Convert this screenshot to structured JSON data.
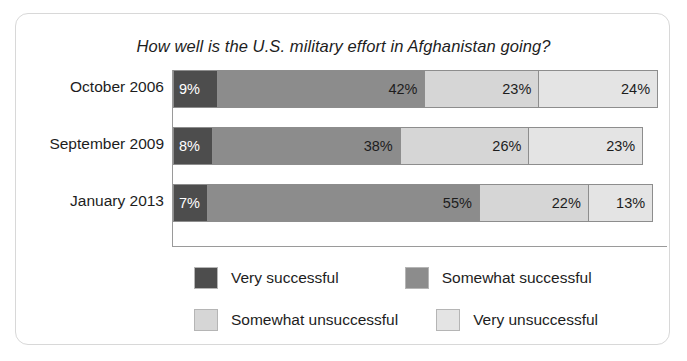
{
  "chart_data": {
    "type": "bar",
    "orientation": "horizontal",
    "stacked": true,
    "title": "How well is the U.S. military effort in Afghanistan going?",
    "xlabel": "",
    "ylabel": "",
    "grid": false,
    "axis_visible": true,
    "legend_position": "bottom",
    "value_suffix": "%",
    "xlim": [
      0,
      100
    ],
    "categories": [
      "October 2006",
      "September 2009",
      "January 2013"
    ],
    "series": [
      {
        "name": "Very successful",
        "color": "#4d4d4d",
        "label_color": "#ffffff",
        "values": [
          9,
          8,
          7
        ],
        "labels": [
          "9%",
          "8%",
          "7%"
        ]
      },
      {
        "name": "Somewhat successful",
        "color": "#8c8c8c",
        "label_color": "#1d1d1d",
        "values": [
          42,
          38,
          55
        ],
        "labels": [
          "42%",
          "38%",
          "55%"
        ]
      },
      {
        "name": "Somewhat unsuccessful",
        "color": "#d6d6d6",
        "label_color": "#1d1d1d",
        "values": [
          23,
          26,
          22
        ],
        "labels": [
          "23%",
          "26%",
          "22%"
        ]
      },
      {
        "name": "Very unsuccessful",
        "color": "#e4e4e4",
        "label_color": "#1d1d1d",
        "values": [
          24,
          23,
          13
        ],
        "labels": [
          "24%",
          "23%",
          "13%"
        ]
      }
    ],
    "row_totals": [
      98,
      95,
      97
    ]
  },
  "legend": {
    "items": [
      {
        "label": "Very successful",
        "color": "#4d4d4d"
      },
      {
        "label": "Somewhat successful",
        "color": "#8c8c8c"
      },
      {
        "label": "Somewhat unsuccessful",
        "color": "#d6d6d6"
      },
      {
        "label": "Very unsuccessful",
        "color": "#e4e4e4"
      }
    ]
  },
  "colors": {
    "card_border": "#d8d8d8",
    "axis": "#9a9a9a",
    "segment_border": "#8d8d8d",
    "text": "#1d1d1d",
    "background": "#ffffff"
  }
}
